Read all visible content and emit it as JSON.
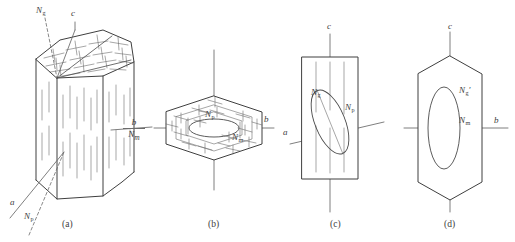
{
  "figure": {
    "background_color": "#ffffff",
    "line_color": "#4a4a4a",
    "axis_color": "#707070",
    "text_color": "#3d3d3d",
    "panel_count": 4
  },
  "panels": [
    {
      "id": "a",
      "caption": "(a)",
      "description": "perspective view of hexagonal prism with crystallographic axes and optical vibration directions",
      "labels": [
        {
          "name": "Ng",
          "base": "N",
          "sub": "g",
          "prime": false
        },
        {
          "name": "c",
          "base": "c",
          "sub": "",
          "prime": false
        },
        {
          "name": "b",
          "base": "b",
          "sub": "",
          "prime": false
        },
        {
          "name": "Nm",
          "base": "N",
          "sub": "m",
          "prime": false
        },
        {
          "name": "a",
          "base": "a",
          "sub": "",
          "prime": false
        },
        {
          "name": "Np",
          "base": "N",
          "sub": "p",
          "prime": false
        }
      ]
    },
    {
      "id": "b",
      "caption": "(b)",
      "description": "basal section, flattened hexagon with central ellipse",
      "labels": [
        {
          "name": "Np",
          "base": "N",
          "sub": "p",
          "prime": false
        },
        {
          "name": "Nm",
          "base": "N",
          "sub": "m",
          "prime": false
        },
        {
          "name": "b",
          "base": "b",
          "sub": "",
          "prime": false
        }
      ]
    },
    {
      "id": "c",
      "caption": "(c)",
      "description": "prismatic section, rectangle with inclined ellipse",
      "labels": [
        {
          "name": "c",
          "base": "c",
          "sub": "",
          "prime": false
        },
        {
          "name": "Ng",
          "base": "N",
          "sub": "g",
          "prime": false
        },
        {
          "name": "Np",
          "base": "N",
          "sub": "p",
          "prime": false
        },
        {
          "name": "a",
          "base": "a",
          "sub": "",
          "prime": false
        }
      ]
    },
    {
      "id": "d",
      "caption": "(d)",
      "description": "elongated hexagon section with upright ellipse",
      "labels": [
        {
          "name": "c",
          "base": "c",
          "sub": "",
          "prime": false
        },
        {
          "name": "Ng_prime",
          "base": "N",
          "sub": "g",
          "prime": true
        },
        {
          "name": "Nm",
          "base": "N",
          "sub": "m",
          "prime": false
        },
        {
          "name": "b",
          "base": "b",
          "sub": "",
          "prime": false
        }
      ]
    }
  ],
  "text": {
    "panel_a": {
      "axis_Ng": "N",
      "axis_Ng_sub": "g",
      "axis_c": "c",
      "axis_b": "b",
      "axis_Nm": "N",
      "axis_Nm_sub": "m",
      "axis_a": "a",
      "axis_Np": "N",
      "axis_Np_sub": "p",
      "caption": "(a)"
    },
    "panel_b": {
      "label_Np": "N",
      "label_Np_sub": "p",
      "label_Nm": "N",
      "label_Nm_sub": "m",
      "axis_b": "b",
      "caption": "(b)"
    },
    "panel_c": {
      "axis_c": "c",
      "label_Ng": "N",
      "label_Ng_sub": "g",
      "label_Np": "N",
      "label_Np_sub": "p",
      "axis_a": "a",
      "caption": "(c)"
    },
    "panel_d": {
      "axis_c": "c",
      "label_Ng": "N",
      "label_Ng_sub": "g",
      "label_Ng_prime": "′",
      "label_Nm": "N",
      "label_Nm_sub": "m",
      "axis_b": "b",
      "caption": "(d)"
    }
  }
}
